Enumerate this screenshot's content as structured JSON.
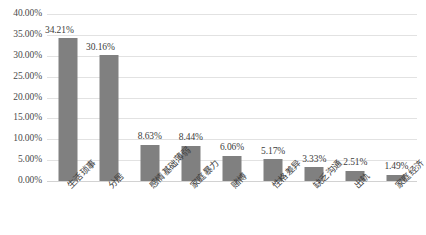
{
  "chart_data": {
    "type": "bar",
    "title": "",
    "subtitle": "",
    "xlabel": "",
    "ylabel": "",
    "categories": [
      "生活琐事",
      "分居",
      "感情基础薄弱",
      "家庭暴力",
      "赌博",
      "性格差异",
      "缺乏沟通",
      "出轨",
      "家庭经济"
    ],
    "values": [
      34.21,
      30.16,
      8.63,
      8.44,
      6.06,
      5.17,
      3.33,
      2.51,
      1.49
    ],
    "data_labels": [
      "34.21%",
      "30.16%",
      "8.63%",
      "8.44%",
      "6.06%",
      "5.17%",
      "3.33%",
      "2.51%",
      "1.49%"
    ],
    "ylim": [
      0,
      40
    ],
    "ytick_values": [
      0,
      5,
      10,
      15,
      20,
      25,
      30,
      35,
      40
    ],
    "ytick_labels": [
      "0.00%",
      "5.00%",
      "10.00%",
      "15.00%",
      "20.00%",
      "25.00%",
      "30.00%",
      "35.00%",
      "40.00%"
    ],
    "grid": "horizontal",
    "legend": "none",
    "series_color": "#808080",
    "gridline_color": "#e2e2e2",
    "background_color": "#ffffff",
    "value_unit": "%"
  }
}
